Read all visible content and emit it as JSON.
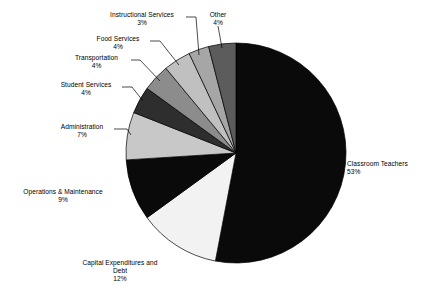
{
  "chart_data": {
    "type": "pie",
    "title": "",
    "subtitle": "",
    "xlabel": "",
    "ylabel": "",
    "legend_position": "none",
    "grid": false,
    "units": "percent",
    "start_angle_deg": 0,
    "direction": "clockwise",
    "categories": [
      "Classroom Teachers",
      "Capital Expenditures and Debt",
      "Operations & Maintenance",
      "Administration",
      "Student Services",
      "Transportation",
      "Food Services",
      "Instructional Services",
      "Other"
    ],
    "values": [
      53,
      12,
      9,
      7,
      4,
      4,
      4,
      3,
      4
    ],
    "slices": [
      {
        "label": "Classroom Teachers",
        "value": 53,
        "pct_text": "53%",
        "color": "#0a0a0a"
      },
      {
        "label": "Capital Expenditures and Debt",
        "value": 12,
        "pct_text": "12%",
        "color": "#f2f2f2"
      },
      {
        "label": "Operations & Maintenance",
        "value": 9,
        "pct_text": "9%",
        "color": "#0a0a0a"
      },
      {
        "label": "Administration",
        "value": 7,
        "pct_text": "7%",
        "color": "#c8c8c8"
      },
      {
        "label": "Student Services",
        "value": 4,
        "pct_text": "4%",
        "color": "#2e2e2e"
      },
      {
        "label": "Transportation",
        "value": 4,
        "pct_text": "4%",
        "color": "#8c8c8c"
      },
      {
        "label": "Food Services",
        "value": 4,
        "pct_text": "4%",
        "color": "#c0c0c0"
      },
      {
        "label": "Instructional Services",
        "value": 3,
        "pct_text": "3%",
        "color": "#a6a6a6"
      },
      {
        "label": "Other",
        "value": 4,
        "pct_text": "4%",
        "color": "#5c5c5c"
      }
    ]
  },
  "labels": {
    "classroom_teachers": {
      "name": "Classroom Teachers",
      "pct": "53%"
    },
    "capital_expenditures": {
      "name_line1": "Capital Expenditures and",
      "name_line2": "Debt",
      "pct": "12%"
    },
    "operations": {
      "name": "Operations & Maintenance",
      "pct": "9%"
    },
    "administration": {
      "name": "Administration",
      "pct": "7%"
    },
    "student_services": {
      "name": "Student Services",
      "pct": "4%"
    },
    "transportation": {
      "name": "Transportation",
      "pct": "4%"
    },
    "food_services": {
      "name": "Food Services",
      "pct": "4%"
    },
    "instructional": {
      "name": "Instructional Services",
      "pct": "3%"
    },
    "other": {
      "name": "Other",
      "pct": "4%"
    }
  },
  "style": {
    "background": "#ffffff",
    "text_color": "#000000",
    "outline_color": "#000000"
  }
}
